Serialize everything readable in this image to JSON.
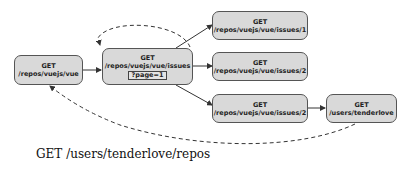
{
  "diagram": {
    "nodes": [
      {
        "id": "repo",
        "method": "GET",
        "path": "/repos/vuejs/vue"
      },
      {
        "id": "issues",
        "method": "GET",
        "path": "/repos/vuejs/vue/issues",
        "query": "?page=1"
      },
      {
        "id": "issue1",
        "method": "GET",
        "path": "/repos/vuejs/vue/issues/1"
      },
      {
        "id": "issue2a",
        "method": "GET",
        "path": "/repos/vuejs/vue/issues/2"
      },
      {
        "id": "issue2b",
        "method": "GET",
        "path": "/repos/vuejs/vue/issues/2"
      },
      {
        "id": "user",
        "method": "GET",
        "path": "/users/tenderlove"
      }
    ],
    "edges": [
      {
        "from": "repo",
        "to": "issues",
        "style": "solid"
      },
      {
        "from": "issues",
        "to": "issues",
        "style": "dashed"
      },
      {
        "from": "issues",
        "to": "issue1",
        "style": "solid"
      },
      {
        "from": "issues",
        "to": "issue2a",
        "style": "solid"
      },
      {
        "from": "issues",
        "to": "issue2b",
        "style": "solid"
      },
      {
        "from": "issue2b",
        "to": "user",
        "style": "solid"
      },
      {
        "from": "user",
        "to": "repo",
        "style": "dashed"
      }
    ],
    "caption": "GET /users/tenderlove/repos"
  }
}
